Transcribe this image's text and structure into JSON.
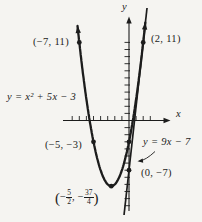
{
  "colors": {
    "ink": "#1c1c1c",
    "paper": "#f5f4f1"
  },
  "labels": {
    "y_axis": "y",
    "x_axis": "x",
    "p_top_left": "(−7, 11)",
    "p_top_right": "(2, 11)",
    "parabola_eq": "y = x² + 5x − 3",
    "p_left": "(−5, −3)",
    "line_eq": "y = 9x − 7",
    "p_y_int": "(0, −7)",
    "vertex": {
      "open": "(",
      "minus1": "−",
      "num1": "5",
      "den1": "2",
      "comma": ", ",
      "minus2": "−",
      "num2": "37",
      "den2": "4",
      "close": ")"
    }
  },
  "chart_data": {
    "type": "line",
    "title": "",
    "xlabel": "x",
    "ylabel": "y",
    "xlim": [
      -9.3,
      6
    ],
    "ylim": [
      -14.5,
      14.5
    ],
    "grid": false,
    "curves": [
      {
        "id": "parabola",
        "equation_label": "y = x² + 5x − 3",
        "coefficients": {
          "a": 1,
          "b": 5,
          "c": -3
        },
        "x_range": [
          -7.25,
          2.3
        ],
        "marked_points": [
          {
            "x": -7,
            "y": 11,
            "label": "(−7, 11)"
          },
          {
            "x": -5,
            "y": -3,
            "label": "(−5, −3)"
          },
          {
            "x": -2.5,
            "y": -9.25,
            "label": "(−5/2, −37/4)"
          },
          {
            "x": 0,
            "y": -3,
            "label": ""
          },
          {
            "x": 2,
            "y": 11,
            "label": "(2, 11)"
          }
        ]
      },
      {
        "id": "tangent-line",
        "equation_label": "y = 9x − 7",
        "slope": 9,
        "intercept": -7,
        "marked_points": [
          {
            "x": 0,
            "y": -7,
            "label": "(0, −7)"
          },
          {
            "x": 2,
            "y": 11,
            "label": "(2, 11)"
          }
        ]
      }
    ],
    "axes": {
      "x_ticks": [
        -8,
        -7,
        -6,
        -5,
        -4,
        -3,
        -2,
        -1,
        1,
        2,
        3
      ],
      "y_ticks": [
        1,
        2,
        3,
        4,
        5,
        6,
        7,
        8,
        9,
        10,
        11,
        -1,
        -2,
        -3,
        -4,
        -5,
        -6,
        -7,
        -8,
        -9,
        -10,
        -11,
        -12
      ]
    }
  }
}
